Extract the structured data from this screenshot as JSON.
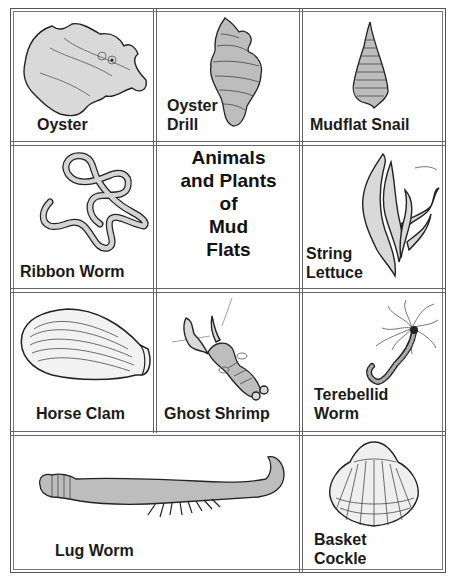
{
  "title": {
    "lines": [
      "Animals",
      "and Plants",
      "of",
      "Mud",
      "Flats"
    ]
  },
  "cards": [
    {
      "id": "oyster",
      "label_lines": [
        "Oyster"
      ],
      "icon": "oyster-illustration"
    },
    {
      "id": "oyster-drill",
      "label_lines": [
        "Oyster",
        "Drill"
      ],
      "icon": "oyster-drill-shell-illustration"
    },
    {
      "id": "mudflat-snail",
      "label_lines": [
        "Mudflat Snail"
      ],
      "icon": "mudflat-snail-shell-illustration"
    },
    {
      "id": "ribbon-worm",
      "label_lines": [
        "Ribbon Worm"
      ],
      "icon": "ribbon-worm-illustration"
    },
    {
      "id": "string-lettuce",
      "label_lines": [
        "String",
        "Lettuce"
      ],
      "icon": "string-lettuce-seaweed-illustration"
    },
    {
      "id": "horse-clam",
      "label_lines": [
        "Horse Clam"
      ],
      "icon": "horse-clam-shell-illustration"
    },
    {
      "id": "ghost-shrimp",
      "label_lines": [
        "Ghost Shrimp"
      ],
      "icon": "ghost-shrimp-illustration"
    },
    {
      "id": "terebellid-worm",
      "label_lines": [
        "Terebellid",
        "Worm"
      ],
      "icon": "terebellid-worm-illustration"
    },
    {
      "id": "lug-worm",
      "label_lines": [
        "Lug Worm"
      ],
      "icon": "lug-worm-illustration"
    },
    {
      "id": "basket-cockle",
      "label_lines": [
        "Basket",
        "Cockle"
      ],
      "icon": "basket-cockle-shell-illustration"
    }
  ]
}
